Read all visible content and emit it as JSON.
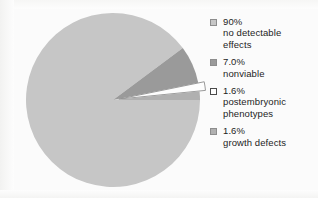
{
  "chart_data": {
    "type": "pie",
    "title": "",
    "subtitle": "",
    "xlabel": "",
    "ylabel": "",
    "legend_position": "right",
    "grid": false,
    "categories": [
      "no detectable effects",
      "nonviable",
      "postembryonic phenotypes",
      "growth defects"
    ],
    "values": [
      90,
      7.0,
      1.6,
      1.6
    ],
    "value_labels": [
      "90%",
      "7.0%",
      "1.6%",
      "1.6%"
    ],
    "colors": [
      "#c6c6c6",
      "#9a9a9a",
      "#fdfdfd",
      "#b0b0b0"
    ],
    "slice_outline_color": "#8f8f8f",
    "exploded": [
      false,
      false,
      true,
      false
    ],
    "start_angle_deg": 0,
    "direction": "clockwise"
  },
  "legend": {
    "items": [
      {
        "swatch": "#c6c6c6",
        "percent": "90%",
        "label": "no detectable\neffects",
        "text": "90%\nno detectable\neffects"
      },
      {
        "swatch": "#9a9a9a",
        "percent": "7.0%",
        "label": "nonviable",
        "text": "7.0%\nnonviable"
      },
      {
        "swatch": "#fdfdfd",
        "percent": "1.6%",
        "label": "postembryonic\nphenotypes",
        "text": "1.6%\npostembryonic\nphenotypes"
      },
      {
        "swatch": "#b0b0b0",
        "percent": "1.6%",
        "label": "growth defects",
        "text": "1.6%\ngrowth defects"
      }
    ]
  },
  "figure": {
    "background": "#fbfbfb"
  }
}
